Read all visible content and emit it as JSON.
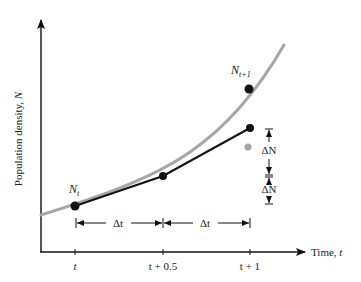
{
  "diagram": {
    "type": "euler-method-illustration",
    "y_axis_label": "Population density, ",
    "y_axis_var": "N",
    "x_axis_label": "Time, ",
    "x_axis_var": "t",
    "ticks": [
      {
        "label": "t",
        "x": 75
      },
      {
        "label": "t + 0.5",
        "x": 163
      },
      {
        "label": "t + 1",
        "x": 250
      }
    ],
    "point_labels": {
      "start": {
        "base": "N",
        "sub": "t"
      },
      "end": {
        "base": "N",
        "sub": "t+1"
      }
    },
    "interval_labels": [
      "Δt",
      "Δt"
    ],
    "delta_labels": [
      "ΔN",
      "ΔN"
    ],
    "colors": {
      "curve": "#a6a6a6",
      "approx_line": "#111111",
      "gray_point": "#a6a6a6",
      "axis": "#111111"
    }
  }
}
